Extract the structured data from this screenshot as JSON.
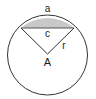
{
  "diagram": {
    "labels": {
      "arc": "a",
      "chord": "c",
      "radius": "r",
      "angle": "A"
    },
    "colors": {
      "stroke": "#333333",
      "segment_fill": "#c8c8c8",
      "background": "#ffffff"
    }
  }
}
